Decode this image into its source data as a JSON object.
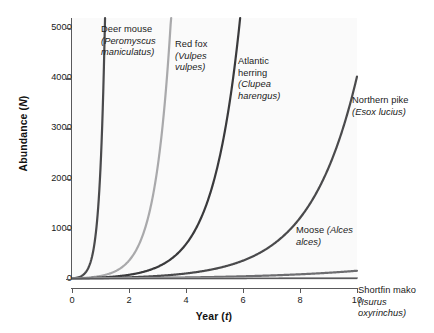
{
  "chart_data": {
    "type": "line",
    "title": "",
    "xlabel": "Year (t)",
    "ylabel": "Abundance (N)",
    "xlim": [
      0,
      10
    ],
    "ylim": [
      0,
      5200
    ],
    "grid": false,
    "legend_position": "inline-annotations",
    "x_ticks": [
      "0",
      "2",
      "4",
      "6",
      "8",
      "10"
    ],
    "x_tick_values": [
      0,
      2,
      4,
      6,
      8,
      10
    ],
    "y_ticks": [
      "0",
      "1000",
      "2000",
      "3000",
      "4000",
      "5000"
    ],
    "y_tick_values": [
      0,
      1000,
      2000,
      3000,
      4000,
      5000
    ],
    "x": [
      0,
      1,
      2,
      3,
      4,
      5,
      6,
      7,
      8,
      9,
      10
    ],
    "series": [
      {
        "name": "Deer mouse",
        "scientific_name": "Peromyscus maniculatus",
        "color": "#4a4a4c",
        "growth_rate_r": 5.4,
        "values": [
          10,
          2200,
          5200,
          5200,
          5200,
          5200,
          5200,
          5200,
          5200,
          5200,
          5200
        ]
      },
      {
        "name": "Red fox",
        "scientific_name": "Vulpes vulpes",
        "color": "#a9a9ab",
        "growth_rate_r": 1.8,
        "values": [
          10,
          60,
          366,
          2210,
          5200,
          5200,
          5200,
          5200,
          5200,
          5200,
          5200
        ]
      },
      {
        "name": "Atlantic herring",
        "scientific_name": "Clupea harengus",
        "color": "#3a3a3c",
        "growth_rate_r": 1.06,
        "values": [
          10,
          29,
          84,
          242,
          700,
          2020,
          5200,
          5200,
          5200,
          5200,
          5200
        ]
      },
      {
        "name": "Northern pike",
        "scientific_name": "Esox lucius",
        "color": "#4a4a4c",
        "growth_rate_r": 0.6,
        "values": [
          10,
          18,
          33,
          60,
          110,
          201,
          366,
          667,
          1215,
          2213,
          4034
        ]
      },
      {
        "name": "Moose",
        "scientific_name": "Alces alces",
        "color": "#6d6d70",
        "growth_rate_r": 0.28,
        "values": [
          10,
          13,
          18,
          23,
          31,
          41,
          54,
          71,
          94,
          124,
          164
        ]
      },
      {
        "name": "Shortfin mako",
        "scientific_name": "Isurus oxyrinchus",
        "color": "#9a9a9c",
        "growth_rate_r": 0.06,
        "values": [
          10,
          11,
          11,
          12,
          13,
          13,
          14,
          15,
          16,
          17,
          18
        ]
      }
    ],
    "annotations": [
      {
        "id": "deer-mouse",
        "text": "Deer mouse\n(Peromyscus\nmaniculatus)"
      },
      {
        "id": "red-fox",
        "text": "Red fox\n(Vulpes\nvulpes)"
      },
      {
        "id": "atlantic-herring",
        "text": "Atlantic\nherring\n(Clupea\nharengus)"
      },
      {
        "id": "northern-pike",
        "text": "Northern\npike (Esox\nlucius)"
      },
      {
        "id": "moose",
        "text": "Moose\n(Alces\nalces)"
      },
      {
        "id": "shortfin-mako",
        "text": "Shortfin\nmako (Isurus\noxyrinchus)"
      }
    ]
  },
  "axes": {
    "y_title_main": "Abundance (",
    "y_title_var": "N",
    "y_title_end": ")",
    "x_title_main": "Year (",
    "x_title_var": "t",
    "x_title_end": ")"
  },
  "labels": {
    "deer_mouse_common": "Deer mouse",
    "deer_mouse_sci": "(Peromyscus maniculatus)",
    "red_fox_common": "Red fox",
    "red_fox_sci": "(Vulpes vulpes)",
    "atlantic_herring_common": "Atlantic herring",
    "atlantic_herring_sci": "(Clupea harengus)",
    "northern_pike_common": "Northern pike",
    "northern_pike_sci": "(Esox lucius)",
    "moose_common": "Moose",
    "moose_sci": "(Alces alces)",
    "shortfin_mako_common": "Shortfin mako",
    "shortfin_mako_sci": "(Isurus oxyrinchus)"
  },
  "colors": {
    "plot_background": "#fafafa",
    "page_background": "#ffffff",
    "axis": "#59595b",
    "text": "#1a1a1a"
  }
}
